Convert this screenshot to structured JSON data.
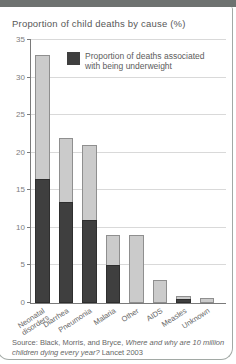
{
  "page": {
    "title": "Proportion of child deaths by cause (%)",
    "source_prefix": "Source: Black, Morris, and Bryce, ",
    "source_title_italic": "Where and why are 10 million children dying every year?",
    "source_suffix": " Lancet 2003"
  },
  "legend": {
    "label": "Proportion of deaths associated\nwith being underweight",
    "swatch_color": "#3f3f3f"
  },
  "chart_data": {
    "type": "bar",
    "stacked_overlay": true,
    "title": "Proportion of child deaths by cause (%)",
    "categories": [
      "Neonatal\ndisorders",
      "Diarrhea",
      "Pneumonia",
      "Malaria",
      "Other",
      "AIDS",
      "Measles",
      "Unknown"
    ],
    "series": [
      {
        "name": "Total proportion of child deaths",
        "color": "#cbcbcb",
        "values": [
          33,
          22,
          21,
          9,
          9,
          3,
          1,
          0.7
        ]
      },
      {
        "name": "Proportion of deaths associated with being underweight",
        "color": "#3f3f3f",
        "values": [
          16.5,
          13.5,
          11,
          5,
          0,
          0,
          0.5,
          0
        ]
      }
    ],
    "xlabel": "",
    "ylabel": "",
    "ylim": [
      0,
      35
    ],
    "yticks": [
      0,
      5,
      10,
      15,
      20,
      25,
      30,
      35
    ],
    "grid": true,
    "legend_position": "top-inside"
  }
}
